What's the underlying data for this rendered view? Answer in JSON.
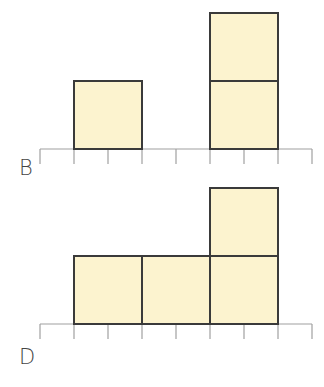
{
  "colors": {
    "fill": "#fcf3cf",
    "stroke": "#3a3a3a",
    "axis": "#a0a0a0"
  },
  "diagrams": [
    {
      "label": "B",
      "axis_y": 149,
      "label_pos": [
        19,
        158
      ],
      "cells": [
        [
          1,
          0
        ],
        [
          5,
          0
        ],
        [
          5,
          1
        ]
      ]
    },
    {
      "label": "D",
      "axis_y": 324,
      "label_pos": [
        19,
        347
      ],
      "cells": [
        [
          1,
          0
        ],
        [
          2,
          0
        ],
        [
          3,
          0
        ],
        [
          3,
          1
        ]
      ]
    }
  ],
  "grid": {
    "x0": 40,
    "unit": 34,
    "ticks": 9,
    "tick_len": 15
  }
}
